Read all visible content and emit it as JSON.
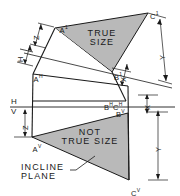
{
  "figure": {
    "colors": {
      "fill": "#b9b9b9",
      "line": "#1a1a1a",
      "background": "#ffffff"
    }
  },
  "labels": {
    "true_size": "TRUE\nSIZE",
    "not_true_size": "NOT\nTRUE SIZE",
    "incline_plane": "INCLINE\nPLANE"
  },
  "vertices": {
    "a1_base": "A",
    "a1_sup": "1",
    "c1_base": "C",
    "c1_sup": "1",
    "b1_base": "B",
    "b1_sup": "1",
    "ah_base": "A",
    "ah_sup": "H",
    "bh_base": "B",
    "bh_sup": "H",
    "ch_base": "C",
    "ch_sup": "H",
    "av_base": "A",
    "av_sup": "V",
    "bv_base": "B",
    "bv_sup": "V",
    "cv_base": "C",
    "cv_sup": "V"
  },
  "fold_line": {
    "h": "H",
    "v": "V"
  },
  "dimensions": {
    "z_top": "Z",
    "h_aux": "H",
    "y_top_right": "Y",
    "x_aux": "X",
    "z_left": "Z",
    "x_right": "X",
    "y_right": "Y"
  }
}
